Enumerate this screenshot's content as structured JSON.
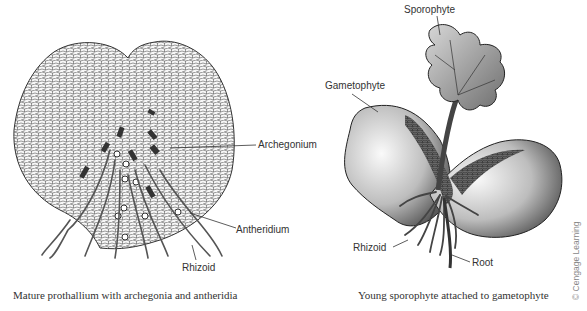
{
  "left_panel": {
    "labels": {
      "archegonium": "Archegonium",
      "antheridium": "Antheridium",
      "rhizoid": "Rhizoid"
    },
    "caption": "Mature prothallium with archegonia and antheridia"
  },
  "right_panel": {
    "labels": {
      "sporophyte": "Sporophyte",
      "gametophyte": "Gametophyte",
      "rhizoid": "Rhizoid",
      "root": "Root"
    },
    "caption": "Young sporophyte attached to gametophyte"
  },
  "credit": "© Cengage Learning",
  "colors": {
    "line": "#333333",
    "cell_fill": "#f4f4f4",
    "gametophyte_shade": "#8a8a8a",
    "sporophyte_shade": "#9a9a9a"
  }
}
